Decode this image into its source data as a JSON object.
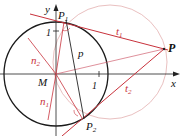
{
  "diagram": {
    "colors": {
      "circle": "#1a1a1a",
      "axis": "#222222",
      "tangent": "#c8323c",
      "normal": "#c8323c",
      "thales": "#e0a8a8",
      "text": "#111111"
    },
    "labels": {
      "y_axis": "y",
      "x_axis": "x",
      "origin": "M",
      "unit_x": "1",
      "unit_y": "1",
      "p1_main": "P",
      "p1_sub": "1",
      "p2_main": "P",
      "p2_sub": "2",
      "p": "P",
      "t1_main": "t",
      "t1_sub": "1",
      "t2_main": "t",
      "t2_sub": "2",
      "n1_main": "n",
      "n1_sub": "1",
      "n2_main": "n",
      "n2_sub": "2",
      "polar": "p"
    }
  }
}
